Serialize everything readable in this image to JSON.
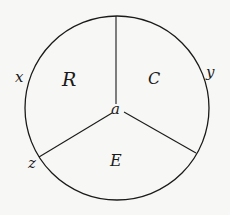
{
  "diagram": {
    "type": "circle-partitioned-into-three-sectors",
    "regions": [
      {
        "id": "R",
        "label": "R"
      },
      {
        "id": "C",
        "label": "C"
      },
      {
        "id": "E",
        "label": "E"
      }
    ],
    "center_label": "a",
    "boundary_points": [
      {
        "id": "x",
        "label": "x"
      },
      {
        "id": "y",
        "label": "y"
      },
      {
        "id": "z",
        "label": "z"
      }
    ],
    "colors": {
      "stroke": "#1a1a1a",
      "background": "#f7f7f5"
    }
  }
}
